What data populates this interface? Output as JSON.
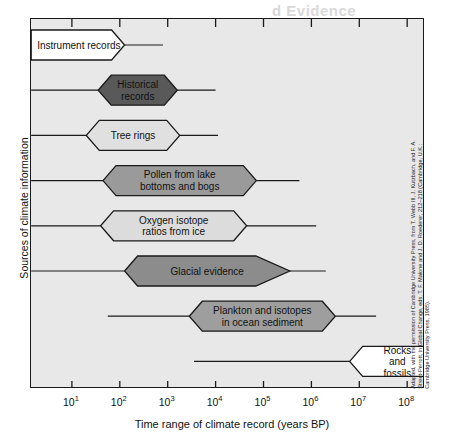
{
  "figure": {
    "ghost_heading": "d Evidence",
    "ghost_subheading": "",
    "x_axis": {
      "title": "Time range of climate record (years BP)",
      "ticks": [
        {
          "label": "10",
          "exp": "1",
          "value": 1
        },
        {
          "label": "10",
          "exp": "2",
          "value": 2
        },
        {
          "label": "10",
          "exp": "3",
          "value": 3
        },
        {
          "label": "10",
          "exp": "4",
          "value": 4
        },
        {
          "label": "10",
          "exp": "5",
          "value": 5
        },
        {
          "label": "10",
          "exp": "6",
          "value": 6
        },
        {
          "label": "10",
          "exp": "7",
          "value": 7
        },
        {
          "label": "10",
          "exp": "8",
          "value": 8
        }
      ]
    },
    "y_axis": {
      "title": "Sources of climate information"
    },
    "credit": "Adapted, with the permission of Cambridge University Press, from T. Webb III, J. Kutzbach, and F. A. Street-Perrott, in Global Change, eds. T. F. Malone and J. D. Roederer, 212–218 (Cambridge, U.K.: Cambridge University Press, 1985)."
  },
  "chart_data": {
    "type": "bar",
    "title": "Time range of climate record (years BP)",
    "xlabel": "Time range of climate record (years BP)",
    "ylabel": "Sources of climate information",
    "xscale": "log10",
    "xlim": [
      0.15,
      8.35
    ],
    "grid": false,
    "legend": null,
    "categories": [
      "Instrument records",
      "Historical records",
      "Tree rings",
      "Pollen from lake bottoms and bogs",
      "Oxygen isotope ratios from ice",
      "Glacial evidence",
      "Plankton and isotopes in ocean sediment",
      "Rocks and fossils"
    ],
    "series": [
      {
        "name": "Time range of climate record",
        "units": "log10 years BP",
        "bands": [
          {
            "label": "Instrument records",
            "label_lines": [
              "Instrument records"
            ],
            "fill": "#ffffff",
            "line_start": 0.15,
            "body_start": 0.15,
            "body_end": 2.1,
            "line_end": 2.9,
            "left_cap": "flat",
            "right_cap": "point"
          },
          {
            "label": "Historical records",
            "label_lines": [
              "Historical",
              "records"
            ],
            "fill": "#595959",
            "line_start": 0.15,
            "body_start": 1.55,
            "body_end": 3.2,
            "line_end": 4.0,
            "left_cap": "point",
            "right_cap": "point"
          },
          {
            "label": "Tree rings",
            "label_lines": [
              "Tree rings"
            ],
            "fill": "#e0e0e0",
            "line_start": 0.15,
            "body_start": 1.3,
            "body_end": 3.25,
            "line_end": 4.05,
            "left_cap": "point",
            "right_cap": "point"
          },
          {
            "label": "Pollen from lake bottoms and bogs",
            "label_lines": [
              "Pollen from lake",
              "bottoms and bogs"
            ],
            "fill": "#9a9a9a",
            "line_start": 0.15,
            "body_start": 1.65,
            "body_end": 4.85,
            "line_end": 5.75,
            "left_cap": "point",
            "right_cap": "point"
          },
          {
            "label": "Oxygen isotope ratios from ice",
            "label_lines": [
              "Oxygen isotope",
              "ratios from ice"
            ],
            "fill": "#dcdcdc",
            "line_start": 0.15,
            "body_start": 1.6,
            "body_end": 4.65,
            "line_end": 6.1,
            "left_cap": "point",
            "right_cap": "point"
          },
          {
            "label": "Glacial evidence",
            "label_lines": [
              "Glacial evidence"
            ],
            "fill": "#8c8c8c",
            "line_start": 0.15,
            "body_start": 2.1,
            "body_end": 5.55,
            "line_end": 6.3,
            "left_cap": "point",
            "right_cap": "point"
          },
          {
            "label": "Plankton and isotopes in ocean sediment",
            "label_lines": [
              "Plankton and isotopes",
              "in ocean sediment"
            ],
            "fill": "#9e9e9e",
            "line_start": 1.75,
            "body_start": 3.45,
            "body_end": 6.5,
            "line_end": 7.35,
            "left_cap": "point",
            "right_cap": "point"
          },
          {
            "label": "Rocks and fossils",
            "label_lines": [
              "Rocks",
              "and",
              "fossils"
            ],
            "fill": "#ffffff",
            "line_start": 3.55,
            "body_start": 6.8,
            "body_end": 8.35,
            "line_end": 8.35,
            "left_cap": "point",
            "right_cap": "flat"
          }
        ]
      }
    ]
  }
}
